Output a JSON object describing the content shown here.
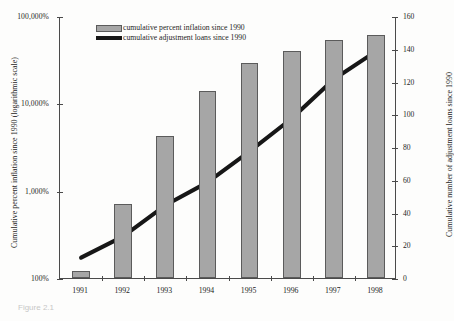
{
  "caption": "Figure 2.1",
  "legend": {
    "position": "top-left-inside",
    "items": [
      {
        "icon": "bar-swatch",
        "label": "cumulative percent inflation since 1990"
      },
      {
        "icon": "line-swatch",
        "label": "cumulative adjustment loans since 1990"
      }
    ]
  },
  "axes": {
    "left": {
      "title": "Cumulative percent inflation since 1990 (logarithmic scale)",
      "ticks": [
        "100%",
        "1,000%",
        "10,000%",
        "100,000%"
      ],
      "scale": "log",
      "min": 100,
      "max": 100000
    },
    "right": {
      "title": "Cumulative number of adjustment loans since 1990",
      "ticks": [
        "0",
        "20",
        "40",
        "60",
        "80",
        "100",
        "120",
        "140",
        "160"
      ],
      "scale": "linear",
      "min": 0,
      "max": 160
    },
    "bottom": {
      "ticks": [
        "1991",
        "1992",
        "1993",
        "1994",
        "1995",
        "1996",
        "1997",
        "1998"
      ]
    }
  },
  "colors": {
    "bar_fill": "#a6a6a6",
    "bar_stroke": "#5b5b5b",
    "line": "#171717",
    "axis": "#4a4a4a",
    "background": "#fdfdfc"
  },
  "chart_data": {
    "type": "bar",
    "title": "",
    "subtitle": "",
    "xlabel": "",
    "ylabel": "Cumulative percent inflation since 1990 (logarithmic scale)",
    "y2label": "Cumulative number of adjustment loans since 1990",
    "categories": [
      "1991",
      "1992",
      "1993",
      "1994",
      "1995",
      "1996",
      "1997",
      "1998"
    ],
    "grid": false,
    "legend_position": "top-left",
    "yscale": "log",
    "ylim": [
      100,
      100000
    ],
    "y2lim": [
      0,
      160
    ],
    "yticks": [
      100,
      1000,
      10000,
      100000
    ],
    "yticklabels": [
      "100%",
      "1,000%",
      "10,000%",
      "100,000%"
    ],
    "y2ticks": [
      0,
      20,
      40,
      60,
      80,
      100,
      120,
      140,
      160
    ],
    "series": [
      {
        "name": "cumulative percent inflation since 1990",
        "type": "bar",
        "axis": "left",
        "values": [
          120,
          700,
          4200,
          14000,
          29000,
          40000,
          53000,
          61000
        ]
      },
      {
        "name": "cumulative adjustment loans since 1990",
        "type": "line",
        "axis": "right",
        "values": [
          13,
          26,
          45,
          59,
          78,
          98,
          122,
          139
        ]
      }
    ]
  }
}
